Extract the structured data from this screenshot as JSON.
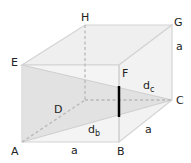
{
  "diagram": {
    "type": "cube-diagonal",
    "vertices": {
      "A": "A",
      "B": "B",
      "C": "C",
      "D": "D",
      "E": "E",
      "F": "F",
      "G": "G",
      "H": "H"
    },
    "edge_labels": {
      "bottom_front": "a",
      "bottom_right": "a",
      "right_back_vertical": "a"
    },
    "diagonals": {
      "face_diagonal": {
        "main": "d",
        "sub": "b"
      },
      "space_diagonal": {
        "main": "d",
        "sub": "c"
      }
    },
    "colors": {
      "edge": "#d4d4d4",
      "hidden_edge": "#b8b8b8",
      "face_fill": "#ececec",
      "triangle_fill": "#dcdcdc",
      "highlight_edge": "#000000",
      "text": "#222222"
    }
  }
}
